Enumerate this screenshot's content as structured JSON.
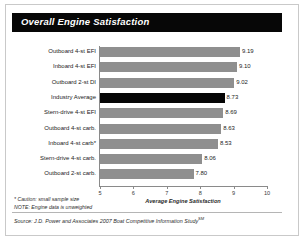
{
  "title": "Overall Engine Satisfaction",
  "chart_data": {
    "type": "bar",
    "orientation": "horizontal",
    "title": "Overall Engine Satisfaction",
    "xlabel": "Average Engine Satisfaction",
    "ylabel": "",
    "xlim": [
      5,
      10
    ],
    "xticks": [
      5,
      6,
      7,
      8,
      9,
      10
    ],
    "xtick_labels": [
      "5",
      "6",
      "7",
      "8",
      "9",
      "10"
    ],
    "grid": false,
    "legend": false,
    "categories": [
      "Outboard 4-st EFI",
      "Inboard 4-st EFI",
      "Outboard 2-st DI",
      "Industry Average",
      "Stern-drive 4-st EFI",
      "Outboard 4-st carb.",
      "Inboard 4-st carb*",
      "Stern-drive 4-st carb.",
      "Outboard 2-st carb."
    ],
    "values": [
      9.19,
      9.1,
      9.02,
      8.73,
      8.69,
      8.63,
      8.53,
      8.06,
      7.8
    ],
    "value_labels": [
      "9.19",
      "9.10",
      "9.02",
      "8.73",
      "8.69",
      "8.63",
      "8.53",
      "8.06",
      "7.80"
    ],
    "highlight_category": "Industry Average",
    "bar_color": "#8f8f8f",
    "highlight_color": "#050505"
  },
  "footnotes": [
    "* Caution: small sample size",
    "NOTE: Engine data is unweighted"
  ],
  "source": "Source: J.D. Power and Associates 2007 Boat Competitive Information Study",
  "source_mark": "SM"
}
